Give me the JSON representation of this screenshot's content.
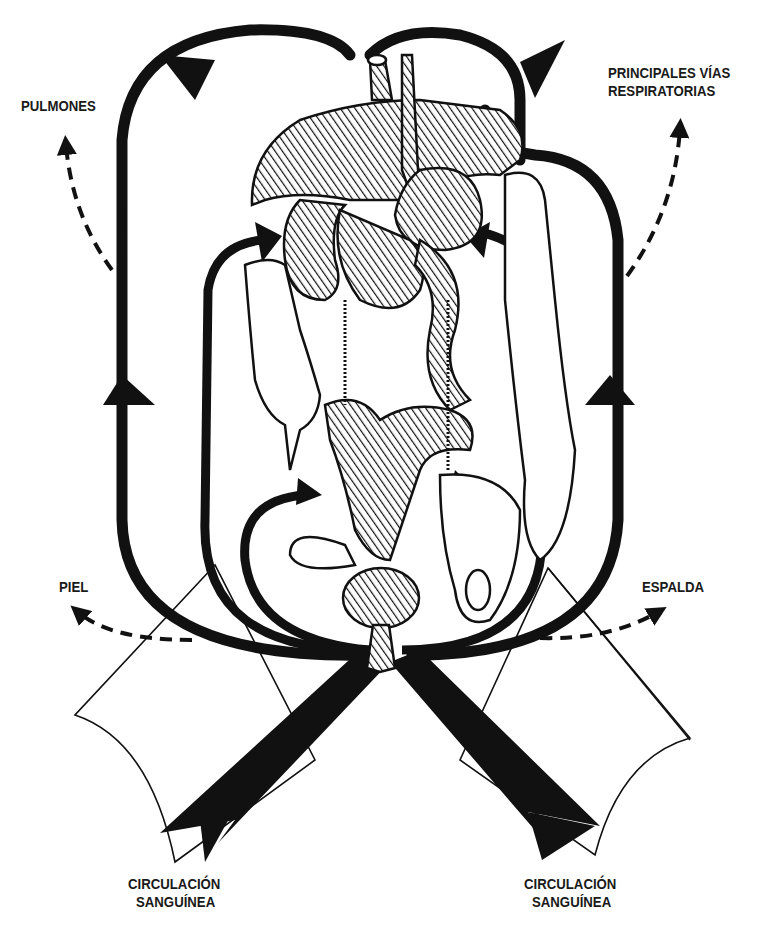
{
  "diagram": {
    "title": "",
    "style": "black-and-white line illustration with hatched organs",
    "colors": {
      "ink": "#111111",
      "background": "#ffffff",
      "hatch": "#111111",
      "label_text": "#1a1a1a"
    },
    "labels": {
      "pulmones": "PULMONES",
      "vias_line1": "PRINCIPALES VÍAS",
      "vias_line2": "RESPIRATORIAS",
      "piel": "PIEL",
      "espalda": "ESPALDA",
      "circ_left_line1": "CIRCULACIÓN",
      "circ_left_line2": "SANGUÍNEA",
      "circ_right_line1": "CIRCULACIÓN",
      "circ_right_line2": "SANGUÍNEA"
    },
    "nodes": [
      {
        "id": "pulmones",
        "label": "PULMONES",
        "position": "top-left"
      },
      {
        "id": "vias",
        "label": "PRINCIPALES VÍAS RESPIRATORIAS",
        "position": "top-right"
      },
      {
        "id": "piel",
        "label": "PIEL",
        "position": "middle-left"
      },
      {
        "id": "espalda",
        "label": "ESPALDA",
        "position": "middle-right"
      },
      {
        "id": "circ_left",
        "label": "CIRCULACIÓN SANGUÍNEA",
        "position": "bottom-left"
      },
      {
        "id": "circ_right",
        "label": "CIRCULACIÓN SANGUÍNEA",
        "position": "bottom-right"
      },
      {
        "id": "organs",
        "label": "",
        "position": "center",
        "description": "abdominal/thoracic organs (liver, stomach, intestines, bladder)"
      }
    ],
    "edges": [
      {
        "from": "circ_left",
        "to": "organs",
        "style": "thick-solid"
      },
      {
        "from": "circ_right",
        "to": "organs",
        "style": "thick-solid"
      },
      {
        "from": "organs",
        "to": "pulmones",
        "style": "dashed"
      },
      {
        "from": "organs",
        "to": "vias",
        "style": "dashed"
      },
      {
        "from": "organs",
        "to": "piel",
        "style": "dashed"
      },
      {
        "from": "organs",
        "to": "espalda",
        "style": "dashed"
      }
    ]
  }
}
